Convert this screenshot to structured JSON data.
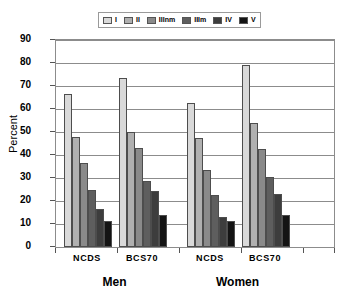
{
  "chart_data": {
    "type": "bar",
    "title": "",
    "xlabel": "",
    "ylabel": "Percent",
    "ylim": [
      0,
      90
    ],
    "ytick_step": 10,
    "yticks": [
      90,
      80,
      70,
      60,
      50,
      40,
      30,
      20,
      10,
      0
    ],
    "grid": true,
    "legend_position": "top",
    "legend_border": true,
    "categories": [
      "NCDS",
      "BCS70",
      "NCDS",
      "BCS70"
    ],
    "group_labels": [
      "Men",
      "Women"
    ],
    "series": [
      {
        "name": "I",
        "color": "#d9d9d9",
        "values": [
          66.5,
          73.5,
          62.5,
          79.0
        ]
      },
      {
        "name": "II",
        "color": "#b0b0b0",
        "values": [
          48.0,
          50.0,
          47.5,
          54.0
        ]
      },
      {
        "name": "IIInm",
        "color": "#8a8a8a",
        "values": [
          36.5,
          43.0,
          33.5,
          42.5
        ]
      },
      {
        "name": "IIIm",
        "color": "#5e5e5e",
        "values": [
          25.0,
          28.5,
          22.5,
          30.5
        ]
      },
      {
        "name": "IV",
        "color": "#3d3d3d",
        "values": [
          16.5,
          24.5,
          13.0,
          23.0
        ]
      },
      {
        "name": "V",
        "color": "#141414",
        "values": [
          11.5,
          14.0,
          11.5,
          14.0
        ]
      }
    ]
  },
  "legend": {
    "items": [
      {
        "label": "I"
      },
      {
        "label": "II"
      },
      {
        "label": "IIInm"
      },
      {
        "label": "IIIm"
      },
      {
        "label": "IV"
      },
      {
        "label": "V"
      }
    ]
  },
  "axes": {
    "y_title": "Percent",
    "y_tick_labels": [
      "90",
      "80",
      "70",
      "60",
      "50",
      "40",
      "30",
      "20",
      "10",
      "0"
    ],
    "x_tick_labels": [
      "NCDS",
      "BCS70",
      "NCDS",
      "BCS70"
    ],
    "x_group_labels": [
      "Men",
      "Women"
    ]
  },
  "colors": {
    "axis": "#8c8c8c",
    "grid": "#8c8c8c",
    "bar_outline": "#4d4d4d",
    "background": "#ffffff",
    "text": "#000000"
  }
}
